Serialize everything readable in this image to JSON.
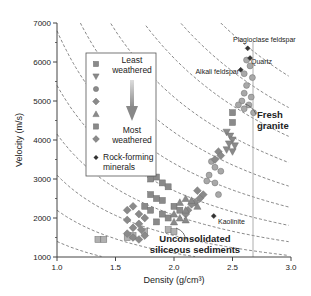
{
  "chart_data": {
    "type": "scatter",
    "title": "",
    "xlabel": "Density (g/cm³)",
    "ylabel": "Velocity (m/s)",
    "xlim": [
      1.0,
      3.0
    ],
    "ylim": [
      1000,
      7000
    ],
    "xticks": [
      "1.0",
      "1.5",
      "2.0",
      "2.5",
      "3.0"
    ],
    "yticks": [
      "1000",
      "2000",
      "3000",
      "4000",
      "5000",
      "6000",
      "7000"
    ],
    "grid": false,
    "legend": {
      "position": "upper-left inside",
      "top_label": "Least weathered",
      "bottom_label": "Most weathered",
      "arrow": "gradient arrow from least to most weathered",
      "markers": [
        "square",
        "triangle-down",
        "circle",
        "diamond",
        "triangle-up",
        "square",
        "diamond"
      ],
      "minerals_label": "Rock-forming minerals"
    },
    "annotations": [
      {
        "text": "Plagioclase feldspar",
        "x": 2.6,
        "y": 6350
      },
      {
        "text": "Quartz",
        "x": 2.65,
        "y": 6100
      },
      {
        "text": "Alkali feldspar",
        "x": 2.57,
        "y": 5800
      },
      {
        "text": "Kaolinite",
        "x": 2.34,
        "y": 2050
      },
      {
        "text": "Fresh granite",
        "x": 2.7,
        "y": 4500
      },
      {
        "text": "Unconsolidated siliceous sediments",
        "x": 2.2,
        "y": 1350
      }
    ],
    "reference_line": {
      "x": 2.65,
      "style": "vertical thin gray"
    },
    "iso_impedance_curves": "dashed hyperbolae (velocity × density constant)",
    "series": [
      {
        "name": "Least weathered (squares)",
        "marker": "square",
        "points": [
          [
            2.5,
            4700
          ],
          [
            2.5,
            4450
          ],
          [
            1.8,
            3000
          ],
          [
            1.85,
            3050
          ],
          [
            1.9,
            2900
          ],
          [
            1.95,
            2800
          ],
          [
            1.8,
            2600
          ],
          [
            1.85,
            2500
          ],
          [
            1.9,
            2450
          ],
          [
            1.75,
            2300
          ],
          [
            1.8,
            2200
          ],
          [
            1.9,
            2100
          ],
          [
            1.95,
            2000
          ],
          [
            1.85,
            1900
          ],
          [
            2.0,
            2300
          ],
          [
            2.05,
            2200
          ],
          [
            1.35,
            1450
          ],
          [
            1.4,
            1450
          ],
          [
            1.6,
            1500
          ],
          [
            1.65,
            1550
          ],
          [
            1.75,
            1650
          ],
          [
            1.95,
            1700
          ],
          [
            2.0,
            1650
          ]
        ]
      },
      {
        "name": "triangle-down",
        "marker": "triangle-down",
        "points": [
          [
            2.45,
            4200
          ],
          [
            2.48,
            4100
          ],
          [
            2.5,
            4000
          ],
          [
            2.47,
            3900
          ],
          [
            2.52,
            3850
          ],
          [
            2.45,
            3750
          ],
          [
            2.5,
            3700
          ]
        ]
      },
      {
        "name": "circle",
        "marker": "circle",
        "points": [
          [
            2.62,
            6050
          ],
          [
            2.65,
            5900
          ],
          [
            2.6,
            5700
          ],
          [
            2.67,
            5600
          ],
          [
            2.62,
            5400
          ],
          [
            2.6,
            5200
          ],
          [
            2.66,
            5100
          ],
          [
            2.58,
            5000
          ],
          [
            2.64,
            4900
          ],
          [
            2.6,
            4800
          ],
          [
            2.68,
            4700
          ],
          [
            2.55,
            4900
          ],
          [
            2.32,
            3450
          ],
          [
            2.35,
            3300
          ],
          [
            2.3,
            3100
          ],
          [
            2.4,
            3200
          ],
          [
            2.35,
            2900
          ],
          [
            2.28,
            2950
          ],
          [
            2.38,
            2600
          ]
        ]
      },
      {
        "name": "diamond",
        "marker": "diamond",
        "points": [
          [
            2.38,
            3700
          ],
          [
            2.4,
            3600
          ],
          [
            2.35,
            3500
          ],
          [
            2.2,
            2700
          ],
          [
            2.25,
            2600
          ],
          [
            2.22,
            2500
          ],
          [
            2.18,
            2400
          ],
          [
            2.15,
            2350
          ],
          [
            2.12,
            2200
          ],
          [
            2.1,
            2100
          ],
          [
            1.6,
            2200
          ],
          [
            1.65,
            2300
          ],
          [
            1.7,
            2100
          ],
          [
            1.75,
            2000
          ],
          [
            1.6,
            1950
          ],
          [
            1.7,
            1850
          ],
          [
            1.65,
            1750
          ],
          [
            1.72,
            1700
          ],
          [
            1.6,
            1600
          ],
          [
            1.65,
            1500
          ],
          [
            1.7,
            1450
          ],
          [
            1.75,
            1550
          ]
        ]
      },
      {
        "name": "triangle-up",
        "marker": "triangle-up",
        "points": [
          [
            2.1,
            2500
          ],
          [
            2.15,
            2450
          ],
          [
            2.2,
            2300
          ],
          [
            2.05,
            2400
          ],
          [
            2.1,
            2200
          ],
          [
            2.0,
            2100
          ],
          [
            2.05,
            2000
          ],
          [
            2.1,
            1950
          ],
          [
            2.0,
            1900
          ]
        ]
      },
      {
        "name": "Rock-forming minerals",
        "marker": "small-diamond-dark",
        "points": [
          [
            2.63,
            6350
          ],
          [
            2.65,
            6100
          ],
          [
            2.57,
            5800
          ],
          [
            2.34,
            2050
          ]
        ]
      }
    ]
  },
  "colors": {
    "marker_fill": "#8a8a8a",
    "marker_stroke": "#6e6e6e",
    "circle_fill": "#a8a8a8",
    "sediment_fill": "#b0b0b0",
    "mineral": "#333333",
    "dash": "#555555",
    "axis": "#444444",
    "text": "#222222"
  }
}
